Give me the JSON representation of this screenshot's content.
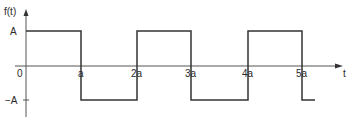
{
  "diagram": {
    "type": "square-wave",
    "y_axis_label": "f(t)",
    "x_axis_label": "t",
    "origin_label": "0",
    "level_labels": {
      "high": "A",
      "low": "−A"
    },
    "tick_labels": [
      "a",
      "2a",
      "3a",
      "4a",
      "5a"
    ],
    "segments": [
      {
        "from": "0",
        "to": "a",
        "level": "A"
      },
      {
        "from": "a",
        "to": "2a",
        "level": "-A"
      },
      {
        "from": "2a",
        "to": "3a",
        "level": "A"
      },
      {
        "from": "3a",
        "to": "4a",
        "level": "-A"
      },
      {
        "from": "4a",
        "to": "5a",
        "level": "A"
      },
      {
        "from": "5a",
        "to": "beyond",
        "level": "-A"
      }
    ],
    "colors": {
      "line": "#333333",
      "axis": "#555555",
      "background": "#ffffff"
    }
  }
}
